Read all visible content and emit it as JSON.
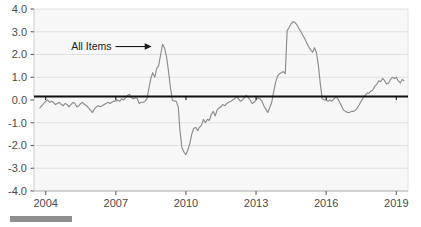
{
  "chart_data": {
    "type": "line",
    "title": "",
    "subtitle": "",
    "xlabel": "",
    "ylabel": "",
    "xlim": [
      2003.5,
      2019.5
    ],
    "ylim": [
      -4.0,
      4.0
    ],
    "grid": true,
    "legend_position": "inline-annotation",
    "y_ticks": [
      "4.0",
      "3.0",
      "2.0",
      "1.0",
      "0.0",
      "-1.0",
      "-2.0",
      "-3.0",
      "-4.0"
    ],
    "y_tick_values": [
      4.0,
      3.0,
      2.0,
      1.0,
      0.0,
      -1.0,
      -2.0,
      -3.0,
      -4.0
    ],
    "x_ticks": [
      "2004",
      "2007",
      "2010",
      "2013",
      "2016",
      "2019"
    ],
    "x_tick_values": [
      2004,
      2007,
      2010,
      2013,
      2016,
      2019
    ],
    "zero_line": 0.0,
    "annotations": [
      {
        "text": "All Items",
        "x": 2008.1,
        "y": 2.35,
        "arrow": "right",
        "points_to_x": 2008.45,
        "points_to_y": 2.3
      }
    ],
    "series": [
      {
        "name": "All Items",
        "color": "#8c8c8c",
        "x": [
          2003.75,
          2003.92,
          2004.0,
          2004.08,
          2004.17,
          2004.25,
          2004.33,
          2004.42,
          2004.5,
          2004.58,
          2004.67,
          2004.75,
          2004.83,
          2004.92,
          2005.0,
          2005.08,
          2005.17,
          2005.25,
          2005.33,
          2005.42,
          2005.5,
          2005.58,
          2005.67,
          2005.75,
          2005.83,
          2005.92,
          2006.0,
          2006.08,
          2006.17,
          2006.25,
          2006.33,
          2006.42,
          2006.5,
          2006.58,
          2006.67,
          2006.75,
          2006.83,
          2006.92,
          2007.0,
          2007.08,
          2007.17,
          2007.25,
          2007.33,
          2007.42,
          2007.5,
          2007.58,
          2007.67,
          2007.75,
          2007.83,
          2007.92,
          2008.0,
          2008.08,
          2008.17,
          2008.25,
          2008.33,
          2008.42,
          2008.5,
          2008.58,
          2008.67,
          2008.75,
          2008.83,
          2008.92,
          2009.0,
          2009.08,
          2009.17,
          2009.25,
          2009.33,
          2009.42,
          2009.5,
          2009.58,
          2009.67,
          2009.75,
          2009.83,
          2009.92,
          2010.0,
          2010.08,
          2010.17,
          2010.25,
          2010.33,
          2010.42,
          2010.5,
          2010.58,
          2010.67,
          2010.75,
          2010.83,
          2010.92,
          2011.0,
          2011.08,
          2011.17,
          2011.25,
          2011.33,
          2011.42,
          2011.5,
          2011.58,
          2011.67,
          2011.75,
          2011.83,
          2011.92,
          2012.0,
          2012.08,
          2012.17,
          2012.25,
          2012.33,
          2012.42,
          2012.5,
          2012.58,
          2012.67,
          2012.75,
          2012.83,
          2012.92,
          2013.0,
          2013.08,
          2013.17,
          2013.25,
          2013.33,
          2013.42,
          2013.5,
          2013.58,
          2013.67,
          2013.75,
          2013.83,
          2013.92,
          2014.0,
          2014.08,
          2014.17,
          2014.25,
          2014.33,
          2014.42,
          2014.5,
          2014.58,
          2014.67,
          2014.75,
          2014.83,
          2014.92,
          2015.0,
          2015.08,
          2015.17,
          2015.25,
          2015.33,
          2015.42,
          2015.5,
          2015.58,
          2015.67,
          2015.75,
          2015.83,
          2015.92,
          2016.0,
          2016.08,
          2016.17,
          2016.25,
          2016.33,
          2016.42,
          2016.5,
          2016.58,
          2016.67,
          2016.75,
          2016.83,
          2016.92,
          2017.0,
          2017.08,
          2017.17,
          2017.25,
          2017.33,
          2017.42,
          2017.5,
          2017.58,
          2017.67,
          2017.75,
          2017.83,
          2017.92,
          2018.0,
          2018.08,
          2018.17,
          2018.25,
          2018.33,
          2018.42,
          2018.5,
          2018.58,
          2018.67,
          2018.75,
          2018.83,
          2018.92,
          2019.0,
          2019.08,
          2019.17,
          2019.25,
          2019.33
        ],
        "values": [
          -0.35,
          -0.15,
          -0.05,
          0.0,
          -0.1,
          -0.05,
          -0.1,
          -0.2,
          -0.15,
          -0.1,
          -0.2,
          -0.25,
          -0.15,
          -0.2,
          -0.3,
          -0.2,
          -0.1,
          -0.15,
          -0.3,
          -0.25,
          -0.15,
          -0.1,
          -0.2,
          -0.25,
          -0.35,
          -0.45,
          -0.55,
          -0.4,
          -0.3,
          -0.25,
          -0.3,
          -0.25,
          -0.2,
          -0.15,
          -0.1,
          -0.15,
          -0.1,
          -0.05,
          -0.05,
          0.0,
          -0.05,
          0.05,
          0.0,
          0.1,
          0.2,
          0.25,
          0.1,
          0.05,
          0.1,
          0.05,
          -0.15,
          -0.1,
          -0.1,
          -0.05,
          0.05,
          0.55,
          0.95,
          1.2,
          1.0,
          1.4,
          1.5,
          2.0,
          2.45,
          2.3,
          1.9,
          1.3,
          0.6,
          0.0,
          -0.05,
          -0.05,
          -0.3,
          -1.4,
          -2.1,
          -2.3,
          -2.4,
          -2.2,
          -1.9,
          -1.5,
          -1.25,
          -1.2,
          -1.35,
          -1.2,
          -1.1,
          -0.85,
          -1.0,
          -0.85,
          -0.9,
          -0.65,
          -0.5,
          -0.7,
          -0.45,
          -0.35,
          -0.3,
          -0.2,
          -0.25,
          -0.15,
          -0.1,
          -0.05,
          0.0,
          0.05,
          0.15,
          0.05,
          -0.05,
          0.0,
          0.1,
          0.2,
          0.1,
          0.0,
          -0.15,
          -0.1,
          0.0,
          0.1,
          0.05,
          -0.05,
          -0.25,
          -0.4,
          -0.55,
          -0.35,
          -0.1,
          0.35,
          0.75,
          1.05,
          1.15,
          1.2,
          1.25,
          1.15,
          3.05,
          3.2,
          3.35,
          3.45,
          3.4,
          3.3,
          3.15,
          3.0,
          2.85,
          2.7,
          2.5,
          2.35,
          2.2,
          2.1,
          2.3,
          2.1,
          1.5,
          0.7,
          0.05,
          0.0,
          0.0,
          -0.05,
          0.0,
          -0.05,
          0.05,
          0.15,
          0.05,
          -0.1,
          -0.3,
          -0.45,
          -0.5,
          -0.55,
          -0.55,
          -0.5,
          -0.5,
          -0.45,
          -0.35,
          -0.2,
          -0.05,
          0.1,
          0.2,
          0.3,
          0.3,
          0.4,
          0.45,
          0.6,
          0.7,
          0.85,
          0.8,
          0.95,
          0.85,
          0.7,
          0.75,
          0.9,
          1.0,
          0.95,
          1.0,
          0.85,
          0.75,
          0.9,
          0.85
        ]
      }
    ]
  },
  "footer": {
    "rule_label": ""
  }
}
